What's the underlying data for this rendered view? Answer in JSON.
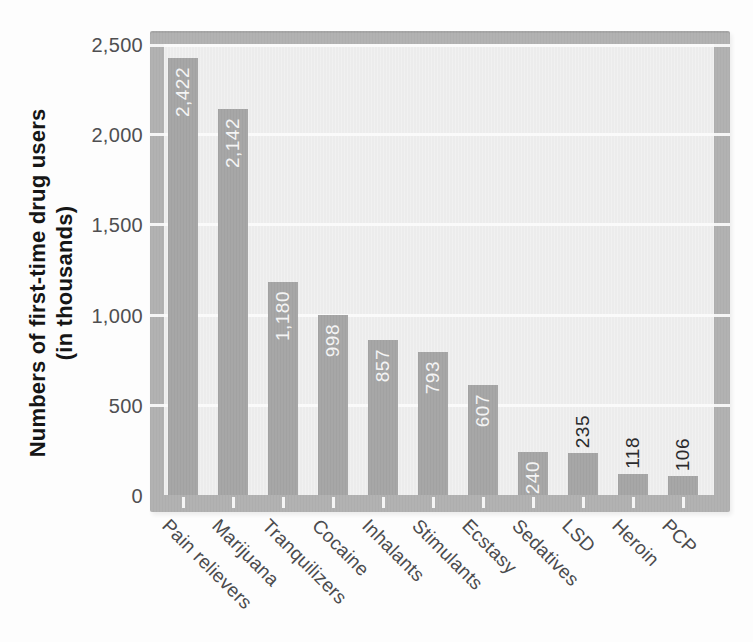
{
  "figure": {
    "y_axis_title_line1": "Numbers of first-time drug users",
    "y_axis_title_line2": "(in thousands)"
  },
  "chart_data": {
    "type": "bar",
    "title": "",
    "xlabel": "",
    "ylabel": "Numbers of first-time drug users (in thousands)",
    "categories": [
      "Pain relievers",
      "Marijuana",
      "Tranquilizers",
      "Cocaine",
      "Inhalants",
      "Stimulants",
      "Ecstasy",
      "Sedatives",
      "LSD",
      "Heroin",
      "PCP"
    ],
    "values": [
      2422,
      2142,
      1180,
      998,
      857,
      793,
      607,
      240,
      235,
      118,
      106
    ],
    "value_labels": [
      "2,422",
      "2,142",
      "1,180",
      "998",
      "857",
      "793",
      "607",
      "240",
      "235",
      "118",
      "106"
    ],
    "value_label_position": [
      "inside",
      "inside",
      "inside",
      "inside",
      "inside",
      "inside",
      "inside",
      "inside",
      "above",
      "above",
      "above"
    ],
    "y_ticks": [
      "0",
      "500",
      "1,000",
      "1,500",
      "2,000",
      "2,500"
    ],
    "ylim": [
      0,
      2500
    ],
    "gridlines": [
      500,
      1000,
      1500,
      2000,
      2500
    ],
    "grid": "horizontal white lines every 500, drawn behind bars, notched through frame",
    "legend": "none",
    "x_label_rotation_deg": 45,
    "value_label_rotation_deg": 90,
    "colors": {
      "page_bg": "#fdfdfd",
      "frame": "#b2b2b2",
      "plot_bg": "#ececec",
      "bar": "#a7a7a7",
      "gridline": "#fafafa",
      "value_label_inside": "#f4f4f4",
      "value_label_above": "#2b2b2d",
      "tick_label": "#4f4f51",
      "category_label": "#4b4b4d",
      "axis_title": "#161616"
    }
  }
}
